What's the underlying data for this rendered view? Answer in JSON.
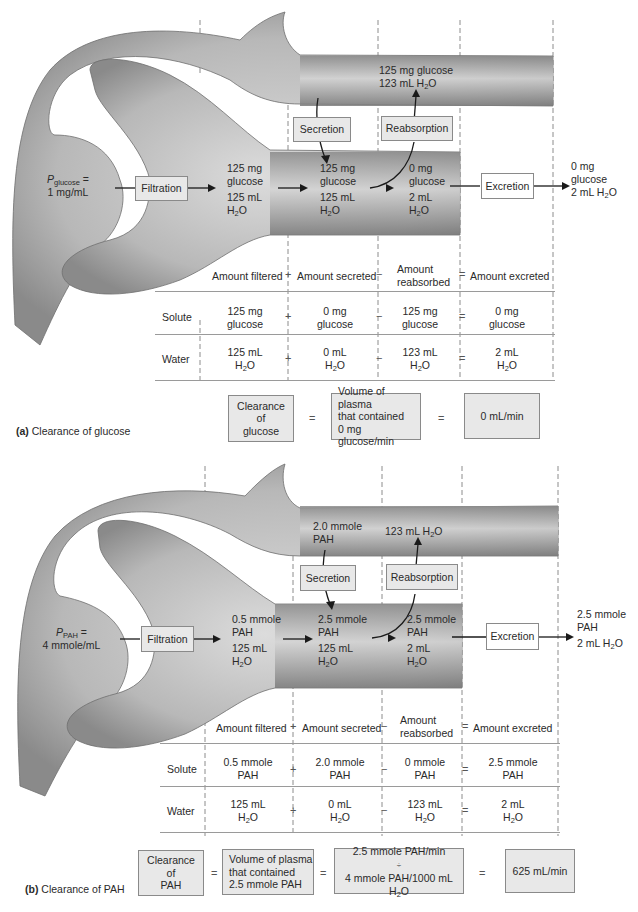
{
  "panel_a": {
    "caption_letter": "(a)",
    "caption_text": "Clearance of glucose",
    "plasma_label_main": "P",
    "plasma_label_sub": "glucose",
    "plasma_label_eq": " =",
    "plasma_value": "1 mg/mL",
    "process_boxes": {
      "filtration": "Filtration",
      "secretion": "Secretion",
      "reabsorption": "Reabsorption",
      "excretion": "Excretion"
    },
    "capillary_content": {
      "line1": "125 mg glucose",
      "line2_prefix": "123 mL H",
      "line2_sub": "2",
      "line2_suffix": "O"
    },
    "tubule_after_filtration": {
      "solute1": "125 mg",
      "solute2": "glucose",
      "water1": "125 mL",
      "water2_prefix": "H",
      "water2_sub": "2",
      "water2_suffix": "O"
    },
    "tubule_after_secretion": {
      "solute1": "125 mg",
      "solute2": "glucose",
      "water1": "125 mL",
      "water2_prefix": "H",
      "water2_sub": "2",
      "water2_suffix": "O"
    },
    "tubule_after_reabsorption": {
      "solute1": "0 mg",
      "solute2": "glucose",
      "water1": "2 mL",
      "water2_prefix": "H",
      "water2_sub": "2",
      "water2_suffix": "O"
    },
    "excreted": {
      "solute1": "0 mg",
      "solute2": "glucose",
      "water_prefix": "2 mL H",
      "water_sub": "2",
      "water_suffix": "O"
    },
    "table": {
      "headers": [
        "Amount filtered",
        "Amount secreted",
        "Amount",
        "reabsorbed",
        "Amount excreted"
      ],
      "operators": [
        "+",
        "−",
        "="
      ],
      "rows": [
        {
          "label": "Solute",
          "cells": [
            [
              "125 mg",
              "glucose"
            ],
            [
              "0 mg",
              "glucose"
            ],
            [
              "125 mg",
              "glucose"
            ],
            [
              "0 mg",
              "glucose"
            ]
          ]
        },
        {
          "label": "Water",
          "cells": [
            [
              "125 mL",
              "H2O"
            ],
            [
              "0 mL",
              "H2O"
            ],
            [
              "123 mL",
              "H2O"
            ],
            [
              "2 mL",
              "H2O"
            ]
          ]
        }
      ]
    },
    "equation": {
      "box1": [
        "Clearance",
        "of",
        "glucose"
      ],
      "eq": "=",
      "box2": [
        "Volume of plasma",
        "that contained",
        "0 mg glucose/min"
      ],
      "result": "0 mL/min"
    }
  },
  "panel_b": {
    "caption_letter": "(b)",
    "caption_text": "Clearance of PAH",
    "plasma_label_main": "P",
    "plasma_label_sub": "PAH",
    "plasma_label_eq": " =",
    "plasma_value": "4 mmole/mL",
    "process_boxes": {
      "filtration": "Filtration",
      "secretion": "Secretion",
      "reabsorption": "Reabsorption",
      "excretion": "Excretion"
    },
    "capillary_secreted": {
      "line1": "2.0 mmole",
      "line2": "PAH"
    },
    "capillary_reabsorbed": {
      "prefix": "123 mL H",
      "sub": "2",
      "suffix": "O"
    },
    "tubule_after_filtration": {
      "solute1": "0.5 mmole",
      "solute2": "PAH",
      "water1": "125 mL",
      "water2_prefix": "H",
      "water2_sub": "2",
      "water2_suffix": "O"
    },
    "tubule_after_secretion": {
      "solute1": "2.5 mmole",
      "solute2": "PAH",
      "water1": "125 mL",
      "water2_prefix": "H",
      "water2_sub": "2",
      "water2_suffix": "O"
    },
    "tubule_after_reabsorption": {
      "solute1": "2.5 mmole",
      "solute2": "PAH",
      "water1": "2 mL",
      "water2_prefix": "H",
      "water2_sub": "2",
      "water2_suffix": "O"
    },
    "excreted": {
      "solute1": "2.5 mmole",
      "solute2": "PAH",
      "water_prefix": "2 mL H",
      "water_sub": "2",
      "water_suffix": "O"
    },
    "table": {
      "headers": [
        "Amount filtered",
        "Amount secreted",
        "Amount",
        "reabsorbed",
        "Amount excreted"
      ],
      "operators": [
        "+",
        "−",
        "="
      ],
      "rows": [
        {
          "label": "Solute",
          "cells": [
            [
              "0.5 mmole",
              "PAH"
            ],
            [
              "2.0 mmole",
              "PAH"
            ],
            [
              "0 mmole",
              "PAH"
            ],
            [
              "2.5 mmole",
              "PAH"
            ]
          ]
        },
        {
          "label": "Water",
          "cells": [
            [
              "125 mL",
              "H2O"
            ],
            [
              "0 mL",
              "H2O"
            ],
            [
              "123 mL",
              "H2O"
            ],
            [
              "2 mL",
              "H2O"
            ]
          ]
        }
      ]
    },
    "equation": {
      "box1": [
        "Clearance",
        "of",
        "PAH"
      ],
      "eq": "=",
      "box2": [
        "Volume of plasma",
        "that contained",
        "2.5 mmole PAH"
      ],
      "box3_numerator": "2.5 mmole PAH/min",
      "box3_divide": "÷",
      "box3_denominator_prefix": "4 mmole PAH/1000 mL H",
      "box3_denominator_sub": "2",
      "box3_denominator_suffix": "O",
      "result": "625 mL/min"
    }
  },
  "colors": {
    "tube_dark": "#7d7d7d",
    "tube_light": "#d6d6d6",
    "box_fill": "#e8e8e8",
    "box_border": "#8a8a8a",
    "dashed_line": "#8c8c8c",
    "text": "#2a2a2a"
  }
}
